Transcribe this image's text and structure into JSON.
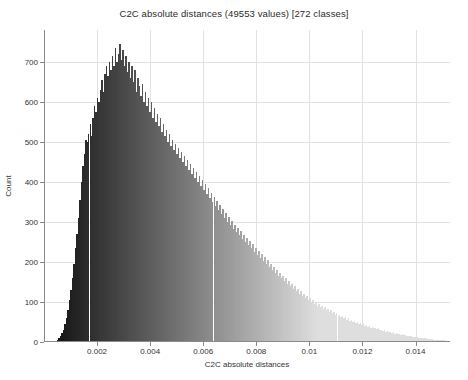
{
  "chart_data": {
    "type": "bar",
    "title": "C2C absolute distances (49553 values)  [272 classes]",
    "xlabel": "C2C absolute distances",
    "ylabel": "Count",
    "xlim": [
      0,
      0.0153
    ],
    "ylim": [
      0,
      780
    ],
    "grid": true,
    "legend": null,
    "n_values": 49553,
    "n_classes": 272,
    "xticks": [
      0.002,
      0.004,
      0.006,
      0.008,
      0.01,
      0.012,
      0.014
    ],
    "xtick_labels": [
      "0.002",
      "0.004",
      "0.006",
      "0.008",
      "0.01",
      "0.012",
      "0.014"
    ],
    "yticks": [
      0,
      100,
      200,
      300,
      400,
      500,
      600,
      700
    ],
    "ytick_labels": [
      "0",
      "100",
      "200",
      "300",
      "400",
      "500",
      "600",
      "700"
    ],
    "bin_width": 5.63e-05,
    "x_start": 0.00042,
    "bar_colors": {
      "low": "#1b1b1b",
      "high": "#dcdcdc"
    },
    "values": [
      3,
      6,
      10,
      14,
      22,
      31,
      44,
      60,
      80,
      105,
      130,
      160,
      195,
      235,
      270,
      310,
      355,
      400,
      440,
      470,
      505,
      500,
      520,
      545,
      515,
      560,
      590,
      575,
      610,
      600,
      630,
      655,
      625,
      670,
      690,
      665,
      700,
      680,
      715,
      690,
      735,
      700,
      720,
      745,
      705,
      730,
      690,
      715,
      675,
      700,
      660,
      690,
      650,
      680,
      625,
      660,
      640,
      615,
      645,
      600,
      625,
      590,
      610,
      575,
      600,
      560,
      585,
      550,
      570,
      540,
      560,
      525,
      545,
      515,
      530,
      500,
      520,
      490,
      505,
      480,
      495,
      470,
      485,
      460,
      475,
      450,
      465,
      440,
      455,
      430,
      445,
      420,
      435,
      410,
      425,
      400,
      415,
      390,
      405,
      380,
      395,
      370,
      385,
      360,
      372,
      350,
      362,
      340,
      352,
      330,
      342,
      320,
      332,
      310,
      322,
      300,
      312,
      292,
      302,
      283,
      293,
      275,
      285,
      267,
      277,
      258,
      268,
      250,
      260,
      242,
      252,
      234,
      244,
      226,
      236,
      218,
      228,
      210,
      220,
      202,
      212,
      195,
      204,
      188,
      196,
      180,
      188,
      173,
      180,
      166,
      173,
      159,
      166,
      152,
      159,
      145,
      152,
      139,
      146,
      133,
      139,
      127,
      133,
      121,
      127,
      116,
      121,
      110,
      116,
      105,
      110,
      100,
      105,
      96,
      100,
      91,
      96,
      87,
      91,
      83,
      87,
      79,
      83,
      75,
      79,
      72,
      75,
      68,
      72,
      65,
      68,
      62,
      65,
      59,
      62,
      56,
      59,
      53,
      56,
      50,
      52,
      47,
      49,
      45,
      47,
      42,
      44,
      40,
      42,
      38,
      40,
      36,
      38,
      34,
      35,
      32,
      34,
      30,
      31,
      28,
      29,
      26,
      27,
      25,
      25,
      23,
      24,
      21,
      22,
      20,
      20,
      18,
      19,
      17,
      17,
      16,
      16,
      14,
      15,
      13,
      13,
      12,
      12,
      11,
      11,
      10,
      10,
      9,
      9,
      8,
      8,
      7,
      7,
      6,
      6,
      5,
      5,
      5,
      4,
      4,
      4,
      3,
      3,
      3,
      3,
      2,
      2,
      2,
      2,
      2,
      1,
      1,
      1,
      1,
      1,
      1,
      1,
      1,
      1,
      1,
      1,
      1
    ]
  }
}
